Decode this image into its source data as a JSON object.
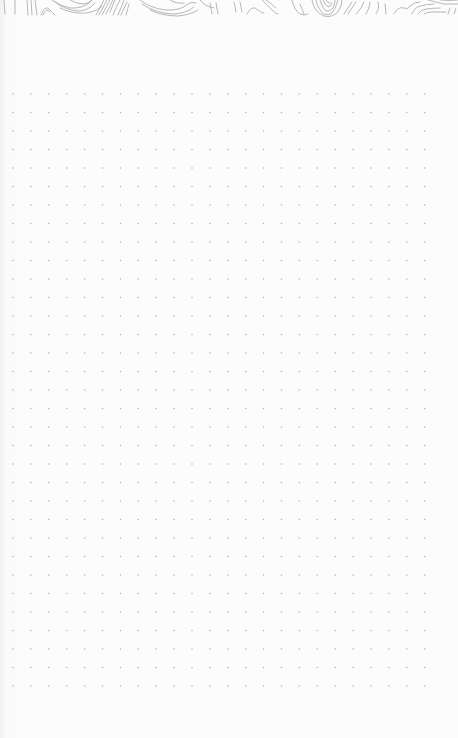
{
  "page": {
    "type": "dotted-notebook-page",
    "background_color": "#fbfbfb"
  },
  "header": {
    "pattern": "topographic-contour-lines",
    "stroke_color": "#9a9a9a"
  },
  "dot_grid": {
    "dot_color": "#b3b3b3",
    "dot_radius": 0.8,
    "origin_x": 13,
    "origin_y": 94,
    "spacing_x": 17.9,
    "spacing_y": 18.5,
    "columns": 24,
    "rows": 33
  }
}
